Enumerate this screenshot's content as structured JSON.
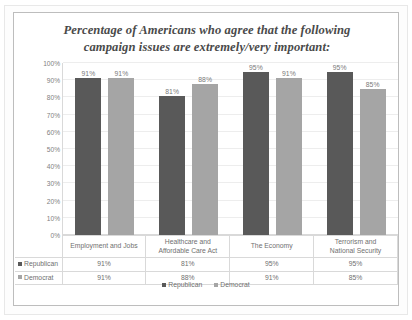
{
  "chart_data": {
    "type": "bar",
    "title": "Percentage of Americans who agree that the following campaign issues are extremely/very important:",
    "title_lines": [
      "Percentage of Americans who agree that the following",
      "campaign issues are extremely/very important:"
    ],
    "xlabel": "",
    "ylabel": "",
    "ylim": [
      0,
      100
    ],
    "grid": true,
    "legend_position": "bottom",
    "y_ticks": [
      "0%",
      "10%",
      "20%",
      "30%",
      "40%",
      "50%",
      "60%",
      "70%",
      "80%",
      "90%",
      "100%"
    ],
    "y_tick_values": [
      0,
      10,
      20,
      30,
      40,
      50,
      60,
      70,
      80,
      90,
      100
    ],
    "categories": [
      "Employment and Jobs",
      "Healthcare and Affordable Care Act",
      "The Economy",
      "Terrorism and National Security"
    ],
    "category_lines": [
      [
        "Employment and Jobs"
      ],
      [
        "Healthcare and",
        "Affordable Care Act"
      ],
      [
        "The Economy"
      ],
      [
        "Terrorism and",
        "National Security"
      ]
    ],
    "series": [
      {
        "name": "Republican",
        "color": "#595959",
        "values": [
          91,
          81,
          95,
          95
        ],
        "labels": [
          "91%",
          "81%",
          "95%",
          "95%"
        ]
      },
      {
        "name": "Democrat",
        "color": "#a5a5a5",
        "values": [
          91,
          88,
          91,
          85
        ],
        "labels": [
          "91%",
          "88%",
          "91%",
          "85%"
        ]
      }
    ]
  },
  "legend": {
    "items": [
      {
        "label": "Republican",
        "color": "#595959"
      },
      {
        "label": "Democrat",
        "color": "#a5a5a5"
      }
    ]
  },
  "data_table": {
    "header": [
      "",
      "Employment and Jobs",
      "Healthcare and Affordable Care Act",
      "The Economy",
      "Terrorism and National Security"
    ],
    "rows": [
      {
        "label": "Republican",
        "values": [
          "91%",
          "81%",
          "95%",
          "95%"
        ]
      },
      {
        "label": "Democrat",
        "values": [
          "91%",
          "88%",
          "91%",
          "85%"
        ]
      }
    ]
  }
}
